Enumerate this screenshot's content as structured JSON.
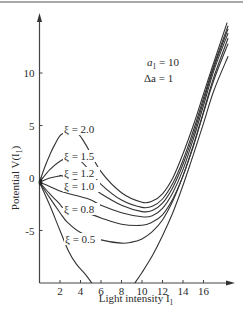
{
  "chart_data": {
    "type": "line",
    "title": "",
    "xlabel": "Light intensity I",
    "xlabel_sub": "1",
    "ylabel": "Potential V(I",
    "ylabel_sub": "1",
    "ylabel_tail": ")",
    "xlim": [
      0,
      18.6
    ],
    "ylim": [
      -10,
      16
    ],
    "x_ticks": [
      2,
      4,
      6,
      8,
      10,
      12,
      14,
      16
    ],
    "x_tick_labels": [
      "2",
      "4",
      "6",
      "8",
      "10",
      "12",
      "14",
      "16"
    ],
    "y_ticks": [
      10,
      5,
      0,
      -5
    ],
    "y_tick_labels": [
      "10",
      "5",
      "0",
      "-5"
    ],
    "grid": false,
    "legend": "none",
    "annotations": [
      {
        "text_main": "a",
        "text_sub": "1",
        "text_tail": " = 10"
      },
      {
        "text_main": "Δa = 1"
      }
    ],
    "series": [
      {
        "name": "ξ = 2.0",
        "label": "ξ = 2.0",
        "x": [
          0,
          0.5,
          1,
          1.5,
          2.2,
          3.6,
          4.5,
          6,
          8,
          10,
          11,
          12,
          13,
          14,
          15,
          16,
          17,
          18.3
        ],
        "y": [
          -0.4,
          1.0,
          2.2,
          3.2,
          4.2,
          4.3,
          3.2,
          0.6,
          -1.4,
          -2.3,
          -2.2,
          -1.5,
          0.0,
          2.3,
          5.0,
          8.0,
          11.0,
          14.8
        ]
      },
      {
        "name": "ξ = 1.5",
        "label": "ξ = 1.5",
        "x": [
          0,
          1,
          2,
          3,
          3.8,
          5,
          6,
          8,
          10,
          11,
          12,
          13,
          14,
          15,
          16,
          17,
          18.4
        ],
        "y": [
          -0.4,
          0.8,
          1.6,
          2.0,
          1.8,
          0.6,
          -0.6,
          -2.1,
          -2.8,
          -2.7,
          -2.0,
          -0.5,
          1.7,
          4.5,
          7.6,
          10.7,
          14.5
        ]
      },
      {
        "name": "ξ = 1.2",
        "label": "ξ = 1.2",
        "x": [
          0,
          1,
          2,
          2.2,
          4.6,
          6,
          8,
          10,
          11,
          12,
          13,
          14,
          15,
          16,
          17,
          18.4
        ],
        "y": [
          -0.4,
          0.0,
          0.2,
          0.2,
          -0.5,
          -1.5,
          -2.6,
          -3.2,
          -3.1,
          -2.4,
          -0.9,
          1.3,
          4.1,
          7.3,
          10.5,
          14.2
        ]
      },
      {
        "name": "ξ = 1.0",
        "label": "ξ = 1.0",
        "x": [
          0,
          1,
          2.2,
          4.8,
          6,
          8,
          10,
          11,
          12,
          13,
          14,
          15,
          16,
          17,
          18.4
        ],
        "y": [
          -0.4,
          -0.8,
          -1.3,
          -2.0,
          -2.6,
          -3.3,
          -3.7,
          -3.6,
          -2.9,
          -1.4,
          0.8,
          3.7,
          6.9,
          10.2,
          13.8
        ]
      },
      {
        "name": "ξ = 0.8",
        "label": "ξ = 0.8",
        "x": [
          0,
          1,
          2,
          2.3,
          4,
          6,
          8,
          10,
          11,
          12,
          13,
          14,
          15,
          16,
          17,
          18.4
        ],
        "y": [
          -0.4,
          -1.5,
          -2.5,
          -2.8,
          -3.1,
          -3.8,
          -4.4,
          -4.5,
          -4.2,
          -3.5,
          -2.0,
          0.2,
          3.1,
          6.3,
          9.6,
          13.3
        ]
      },
      {
        "name": "ξ = 0.8 (lower)",
        "label": "",
        "x": [
          0,
          1,
          2,
          2.7,
          4,
          6,
          8,
          9,
          10,
          11,
          12,
          13,
          14,
          15,
          16,
          17,
          18.4
        ],
        "y": [
          -0.4,
          -1.9,
          -3.3,
          -4.2,
          -5.2,
          -5.9,
          -6.2,
          -6.1,
          -5.8,
          -5.1,
          -4.0,
          -2.2,
          0.2,
          3.0,
          6.2,
          9.3,
          12.8
        ]
      },
      {
        "name": "ξ = 0.5",
        "label": "ξ = 0.5",
        "x": [
          0,
          1,
          2,
          2.8,
          3.6,
          4.5,
          5.1
        ],
        "y": [
          -0.4,
          -2.6,
          -5.0,
          -6.9,
          -8.2,
          -9.2,
          -10.0
        ],
        "x2": [
          9.3,
          10,
          11,
          12,
          13,
          14,
          15,
          16,
          17,
          18.4
        ],
        "y2": [
          -10.0,
          -9.0,
          -7.4,
          -5.5,
          -3.3,
          -0.7,
          2.2,
          5.2,
          8.3,
          11.6
        ]
      }
    ]
  }
}
